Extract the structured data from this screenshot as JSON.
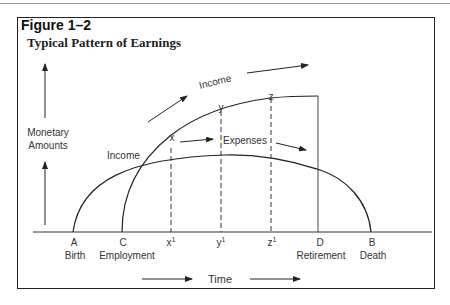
{
  "figure": {
    "number": "Figure 1–2",
    "title": "Typical Pattern of Earnings"
  },
  "axes": {
    "y_label_line1": "Monetary",
    "y_label_line2": "Amounts",
    "x_label": "Time"
  },
  "x_points": [
    {
      "letter": "A",
      "caption": "Birth"
    },
    {
      "letter": "C",
      "caption": "Employment"
    },
    {
      "letter": "x",
      "sup": "1",
      "caption": ""
    },
    {
      "letter": "y",
      "sup": "1",
      "caption": ""
    },
    {
      "letter": "z",
      "sup": "1",
      "caption": ""
    },
    {
      "letter": "D",
      "caption": "Retirement"
    },
    {
      "letter": "B",
      "caption": "Death"
    }
  ],
  "curve_labels": {
    "income_curve": "Income",
    "expenses_curve": "Expenses",
    "point_E": "E",
    "point_F": "F",
    "point_G": "G",
    "point_x": "x",
    "point_y": "y",
    "point_z": "z",
    "income_side_label": "Income"
  }
}
